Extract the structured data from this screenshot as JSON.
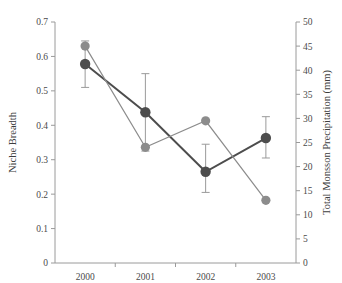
{
  "chart_data": {
    "type": "line",
    "title": "",
    "xlabel": "",
    "categories": [
      "2000",
      "2001",
      "2002",
      "2003"
    ],
    "grid": false,
    "legend": "none",
    "axes": {
      "left": {
        "label": "Niche Breadth",
        "ylim": [
          0,
          0.7
        ],
        "ticks": [
          0,
          0.1,
          0.2,
          0.3,
          0.4,
          0.5,
          0.6,
          0.7
        ],
        "tick_labels": [
          "0",
          "0.1",
          "0.2",
          "0.3",
          "0.4",
          "0.5",
          "0.6",
          "0.7"
        ]
      },
      "right": {
        "label": "Total Monsson Precipitation (mm)",
        "ylim": [
          0,
          50
        ],
        "ticks": [
          0,
          5,
          10,
          15,
          20,
          25,
          30,
          35,
          40,
          45,
          50
        ],
        "tick_labels": [
          "0",
          "5",
          "10",
          "15",
          "20",
          "25",
          "30",
          "35",
          "40",
          "45",
          "50"
        ]
      }
    },
    "series": [
      {
        "name": "Niche Breadth",
        "axis": "left",
        "color": "#4d4d4d",
        "marker": "circle",
        "values": [
          0.578,
          0.438,
          0.265,
          0.363
        ],
        "error_low": [
          0.51,
          0.325,
          0.205,
          0.305
        ],
        "error_high": [
          0.645,
          0.55,
          0.345,
          0.425
        ]
      },
      {
        "name": "Total Monsson Precipitation",
        "axis": "right",
        "color": "#8c8c8c",
        "marker": "circle",
        "values": [
          45.0,
          24.0,
          29.5,
          13.0
        ],
        "error_low": null,
        "error_high": null
      }
    ]
  }
}
